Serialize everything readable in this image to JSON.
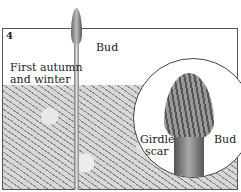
{
  "figure": {
    "panel_number": "4",
    "caption": "First autumn and winter",
    "caption_lines": [
      "First autumn",
      "and winter"
    ],
    "labels": {
      "bud_top": "Bud",
      "bud_inset": "Bud",
      "girdle_scar": "Girdle scar",
      "girdle_scar_lines": [
        "Girdle",
        "scar"
      ]
    }
  }
}
